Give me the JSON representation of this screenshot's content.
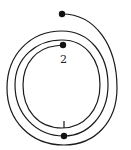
{
  "diagram": {
    "type": "spiral-path",
    "stroke_color": "#1a1a1a",
    "background": "#ffffff",
    "labels": {
      "point_1": "1",
      "point_2": "2"
    },
    "points": [
      {
        "name": "start",
        "x": 62,
        "y": 14
      },
      {
        "name": "middle-bottom",
        "x": 64,
        "y": 136
      },
      {
        "name": "end",
        "x": 63,
        "y": 45
      }
    ]
  }
}
